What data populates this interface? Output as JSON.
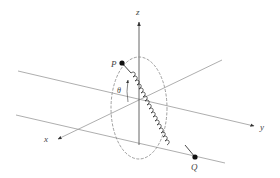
{
  "diagram": {
    "type": "3d-axes-spring",
    "labels": {
      "z_axis": "z",
      "x_axis": "x",
      "y_axis": "y",
      "point_p": "P",
      "point_q": "Q",
      "angle": "θ"
    },
    "colors": {
      "line": "#999999",
      "axis": "#555555",
      "spring": "#333333",
      "point": "#111111",
      "ellipse": "#888888"
    }
  }
}
